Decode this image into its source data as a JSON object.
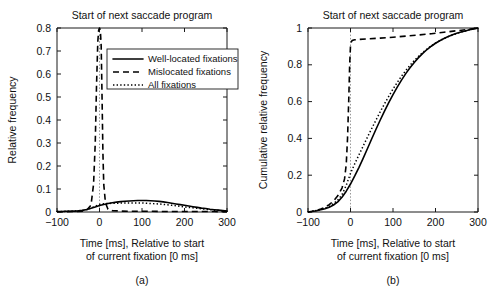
{
  "figure": {
    "caption_a": "(a)",
    "caption_b": "(b)"
  },
  "chart_data": [
    {
      "id": "panel-a",
      "type": "line",
      "title": "Start of next saccade program",
      "xlabel_line1": "Time [ms], Relative to start",
      "xlabel_line2": "of current fixation [0 ms]",
      "ylabel": "Relative frequency",
      "xlim": [
        -100,
        300
      ],
      "ylim": [
        0,
        0.8
      ],
      "xticks": [
        -100,
        0,
        100,
        200,
        300
      ],
      "xticklabels": [
        "−100",
        "0",
        "100",
        "200",
        "300"
      ],
      "yticks": [
        0,
        0.1,
        0.2,
        0.3,
        0.4,
        0.5,
        0.6,
        0.7,
        0.8
      ],
      "yticklabels": [
        "0",
        "0.1",
        "0.2",
        "0.3",
        "0.4",
        "0.5",
        "0.6",
        "0.7",
        "0.8"
      ],
      "grid": false,
      "marker_line_x": 0,
      "legend": {
        "position": "upper-center-right",
        "entries": [
          {
            "label": "Well-located fixations",
            "style": "solid"
          },
          {
            "label": "Mislocated fixations",
            "style": "dashed"
          },
          {
            "label": "All fixations",
            "style": "dotted"
          }
        ]
      },
      "series": [
        {
          "name": "Well-located fixations",
          "style": "solid",
          "x": [
            -100,
            -90,
            -80,
            -70,
            -60,
            -50,
            -40,
            -30,
            -20,
            -10,
            0,
            10,
            20,
            30,
            40,
            50,
            60,
            70,
            80,
            90,
            100,
            110,
            120,
            130,
            140,
            150,
            160,
            170,
            180,
            190,
            200,
            210,
            220,
            230,
            240,
            250,
            260,
            270,
            280,
            290,
            300
          ],
          "y": [
            0.002,
            0.002,
            0.003,
            0.003,
            0.004,
            0.005,
            0.007,
            0.011,
            0.016,
            0.022,
            0.028,
            0.033,
            0.037,
            0.04,
            0.043,
            0.045,
            0.047,
            0.048,
            0.049,
            0.05,
            0.05,
            0.05,
            0.049,
            0.048,
            0.046,
            0.044,
            0.041,
            0.038,
            0.035,
            0.032,
            0.029,
            0.026,
            0.023,
            0.02,
            0.017,
            0.015,
            0.012,
            0.01,
            0.008,
            0.006,
            0.004
          ]
        },
        {
          "name": "Mislocated fixations",
          "style": "dashed",
          "x": [
            -100,
            -60,
            -40,
            -30,
            -20,
            -14,
            -10,
            -7,
            -4,
            -2,
            0,
            2,
            4,
            6,
            8,
            10,
            14,
            20,
            30,
            50,
            80,
            120,
            170,
            220,
            270,
            300
          ],
          "y": [
            0.001,
            0.002,
            0.004,
            0.008,
            0.03,
            0.12,
            0.3,
            0.55,
            0.74,
            0.79,
            0.8,
            0.79,
            0.72,
            0.5,
            0.26,
            0.12,
            0.04,
            0.012,
            0.006,
            0.004,
            0.003,
            0.003,
            0.002,
            0.002,
            0.002,
            0.001
          ]
        },
        {
          "name": "All fixations",
          "style": "dotted",
          "x": [
            -100,
            -90,
            -80,
            -70,
            -60,
            -50,
            -40,
            -30,
            -20,
            -10,
            0,
            10,
            20,
            30,
            40,
            50,
            60,
            70,
            80,
            90,
            100,
            110,
            120,
            130,
            140,
            150,
            160,
            170,
            180,
            190,
            200,
            210,
            220,
            230,
            240,
            250,
            260,
            270,
            280,
            290,
            300
          ],
          "y": [
            0.002,
            0.002,
            0.003,
            0.003,
            0.004,
            0.005,
            0.007,
            0.011,
            0.017,
            0.025,
            0.033,
            0.036,
            0.037,
            0.038,
            0.038,
            0.039,
            0.039,
            0.039,
            0.039,
            0.039,
            0.039,
            0.038,
            0.037,
            0.036,
            0.035,
            0.033,
            0.031,
            0.029,
            0.027,
            0.025,
            0.022,
            0.02,
            0.018,
            0.016,
            0.014,
            0.012,
            0.01,
            0.008,
            0.007,
            0.005,
            0.004
          ]
        }
      ]
    },
    {
      "id": "panel-b",
      "type": "line",
      "title": "Start of next saccade program",
      "xlabel_line1": "Time [ms], Relative to start",
      "xlabel_line2": "of current fixation [0 ms]",
      "ylabel": "Cumulative relative frequency",
      "xlim": [
        -100,
        300
      ],
      "ylim": [
        0,
        1
      ],
      "xticks": [
        -100,
        0,
        100,
        200,
        300
      ],
      "xticklabels": [
        "−100",
        "0",
        "100",
        "200",
        "300"
      ],
      "yticks": [
        0,
        0.2,
        0.4,
        0.6,
        0.8,
        1
      ],
      "yticklabels": [
        "0",
        "0.2",
        "0.4",
        "0.6",
        "0.8",
        "1"
      ],
      "grid": false,
      "marker_line_x": 0,
      "series": [
        {
          "name": "Well-located fixations",
          "style": "solid",
          "x": [
            -100,
            -90,
            -80,
            -70,
            -60,
            -50,
            -40,
            -30,
            -20,
            -10,
            0,
            10,
            20,
            30,
            40,
            50,
            60,
            70,
            80,
            90,
            100,
            110,
            120,
            130,
            140,
            150,
            160,
            170,
            180,
            190,
            200,
            210,
            220,
            230,
            240,
            250,
            260,
            270,
            280,
            290,
            300
          ],
          "y": [
            0.0,
            0.003,
            0.007,
            0.012,
            0.018,
            0.026,
            0.038,
            0.055,
            0.08,
            0.113,
            0.152,
            0.196,
            0.243,
            0.293,
            0.345,
            0.398,
            0.45,
            0.5,
            0.548,
            0.594,
            0.638,
            0.679,
            0.717,
            0.752,
            0.784,
            0.813,
            0.839,
            0.862,
            0.883,
            0.901,
            0.917,
            0.931,
            0.943,
            0.954,
            0.963,
            0.971,
            0.978,
            0.984,
            0.99,
            0.995,
            1.0
          ]
        },
        {
          "name": "Mislocated fixations",
          "style": "dashed",
          "x": [
            -100,
            -90,
            -80,
            -70,
            -60,
            -50,
            -40,
            -30,
            -20,
            -14,
            -10,
            -7,
            -4,
            -2,
            0,
            2,
            4,
            6,
            8,
            10,
            20,
            40,
            70,
            100,
            130,
            160,
            190,
            220,
            250,
            275,
            290,
            300
          ],
          "y": [
            0.0,
            0.004,
            0.009,
            0.016,
            0.026,
            0.04,
            0.06,
            0.088,
            0.13,
            0.18,
            0.26,
            0.4,
            0.62,
            0.8,
            0.905,
            0.925,
            0.932,
            0.934,
            0.935,
            0.936,
            0.938,
            0.941,
            0.945,
            0.95,
            0.956,
            0.962,
            0.969,
            0.977,
            0.985,
            0.992,
            0.997,
            1.0
          ]
        },
        {
          "name": "All fixations",
          "style": "dotted",
          "x": [
            -100,
            -90,
            -80,
            -70,
            -60,
            -50,
            -40,
            -30,
            -20,
            -10,
            0,
            10,
            20,
            30,
            40,
            50,
            60,
            70,
            80,
            90,
            100,
            110,
            120,
            130,
            140,
            150,
            160,
            170,
            180,
            190,
            200,
            210,
            220,
            230,
            240,
            250,
            260,
            270,
            280,
            290,
            300
          ],
          "y": [
            0.0,
            0.004,
            0.008,
            0.014,
            0.021,
            0.031,
            0.045,
            0.065,
            0.094,
            0.145,
            0.21,
            0.262,
            0.311,
            0.359,
            0.407,
            0.454,
            0.5,
            0.545,
            0.588,
            0.629,
            0.668,
            0.704,
            0.738,
            0.769,
            0.797,
            0.823,
            0.846,
            0.867,
            0.886,
            0.903,
            0.918,
            0.931,
            0.943,
            0.953,
            0.962,
            0.97,
            0.978,
            0.984,
            0.99,
            0.995,
            1.0
          ]
        }
      ]
    }
  ]
}
